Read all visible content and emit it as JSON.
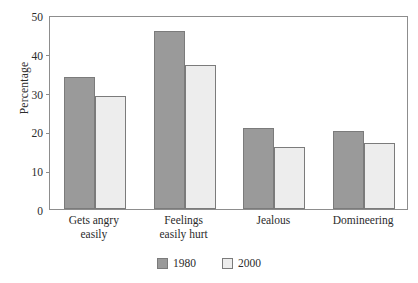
{
  "chart_data": {
    "type": "bar",
    "title": "",
    "xlabel": "",
    "ylabel": "Percentage",
    "ylim": [
      0,
      50
    ],
    "yticks": [
      0,
      10,
      20,
      30,
      40,
      50
    ],
    "ytick_labels": [
      "0",
      "10",
      "20",
      "30",
      "40",
      "50"
    ],
    "grid": false,
    "legend_position": "bottom-center",
    "categories": [
      "Gets angry easily",
      "Feelings easily hurt",
      "Jealous",
      "Domineering"
    ],
    "category_lines": [
      [
        "Gets angry",
        "easily"
      ],
      [
        "Feelings",
        "easily hurt"
      ],
      [
        "Jealous"
      ],
      [
        "Domineering"
      ]
    ],
    "series": [
      {
        "name": "1980",
        "color": "#9a9a9a",
        "values": [
          34,
          46,
          21,
          20
        ]
      },
      {
        "name": "2000",
        "color": "#ededed",
        "values": [
          29,
          37,
          16,
          17
        ]
      }
    ]
  },
  "colors": {
    "series_1980": "#9a9a9a",
    "series_2000": "#ededed",
    "bar_border": "#7b7b7b",
    "axis": "#8d8d8d",
    "text": "#2b2b2b",
    "background": "#ffffff"
  }
}
